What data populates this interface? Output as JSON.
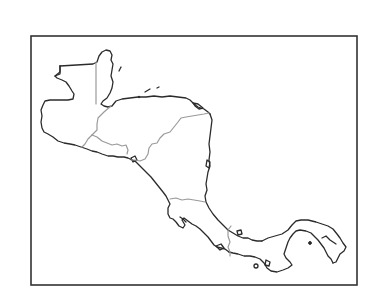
{
  "map": {
    "title": "",
    "region": "Central America outline map",
    "frame": {
      "x": 31,
      "y": 36,
      "width": 326,
      "height": 249
    },
    "colors": {
      "coastline": "#2b2b2b",
      "borders": "#9a9a9a",
      "frame": "#333333",
      "background": "#ffffff"
    },
    "labels": []
  }
}
